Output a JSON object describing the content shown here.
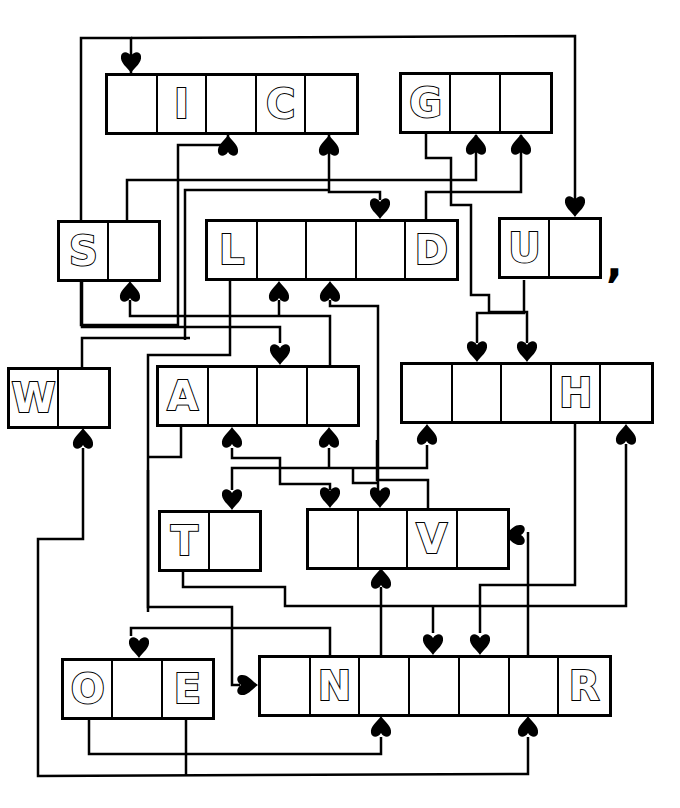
{
  "puzzle": {
    "colors": {
      "line": "#000000",
      "background": "#ffffff",
      "letter_fill": "#ffffff"
    },
    "words": [
      {
        "id": "w1",
        "x": 105,
        "y": 73,
        "cells": [
          "",
          "I",
          "",
          "C",
          ""
        ]
      },
      {
        "id": "w2",
        "x": 399,
        "y": 72,
        "cells": [
          "G",
          "",
          ""
        ]
      },
      {
        "id": "w3",
        "x": 57,
        "y": 220,
        "cells": [
          "S",
          ""
        ]
      },
      {
        "id": "w4",
        "x": 205,
        "y": 219,
        "cells": [
          "L",
          "",
          "",
          "",
          "D"
        ]
      },
      {
        "id": "w5",
        "x": 498,
        "y": 217,
        "cells": [
          "U",
          ""
        ]
      },
      {
        "id": "w6",
        "x": 7,
        "y": 367,
        "cells": [
          "W",
          ""
        ]
      },
      {
        "id": "w7",
        "x": 156,
        "y": 365,
        "cells": [
          "A",
          "",
          "",
          ""
        ]
      },
      {
        "id": "w8",
        "x": 400,
        "y": 362,
        "cells": [
          "",
          "",
          "",
          "H",
          ""
        ]
      },
      {
        "id": "w9",
        "x": 158,
        "y": 510,
        "cells": [
          "T",
          ""
        ]
      },
      {
        "id": "w10",
        "x": 306,
        "y": 508,
        "cells": [
          "",
          "",
          "V",
          ""
        ]
      },
      {
        "id": "w11",
        "x": 61,
        "y": 658,
        "cells": [
          "O",
          "",
          "E"
        ]
      },
      {
        "id": "w12",
        "x": 258,
        "y": 655,
        "cells": [
          "",
          "N",
          "",
          "",
          "",
          "",
          "R"
        ]
      }
    ],
    "punctuation": {
      "comma": ","
    }
  }
}
